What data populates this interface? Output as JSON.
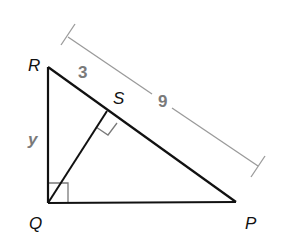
{
  "diagram": {
    "type": "right-triangle-with-altitude",
    "vertices": [
      {
        "id": "R",
        "label": "R",
        "x": 48,
        "y": 67
      },
      {
        "id": "Q",
        "label": "Q",
        "x": 48,
        "y": 203
      },
      {
        "id": "P",
        "label": "P",
        "x": 236,
        "y": 202
      },
      {
        "id": "S",
        "label": "S",
        "x": 107,
        "y": 111
      }
    ],
    "segments": [
      {
        "from": "R",
        "to": "Q",
        "label": "y"
      },
      {
        "from": "Q",
        "to": "P"
      },
      {
        "from": "R",
        "to": "P"
      },
      {
        "from": "Q",
        "to": "S",
        "note": "altitude"
      }
    ],
    "right_angles": [
      "Q",
      "S"
    ],
    "measurements": {
      "RS": "3",
      "RP": "9",
      "RQ": "y"
    },
    "colors": {
      "triangle": "#111111",
      "dimension_line": "#9a9a9a",
      "right_angle_marks": "#7a7a7a",
      "measure_text": "#7a7a7a"
    }
  },
  "labels": {
    "R": "R",
    "Q": "Q",
    "P": "P",
    "S": "S",
    "rs_length": "3",
    "rp_length": "9",
    "rq_length": "y"
  }
}
